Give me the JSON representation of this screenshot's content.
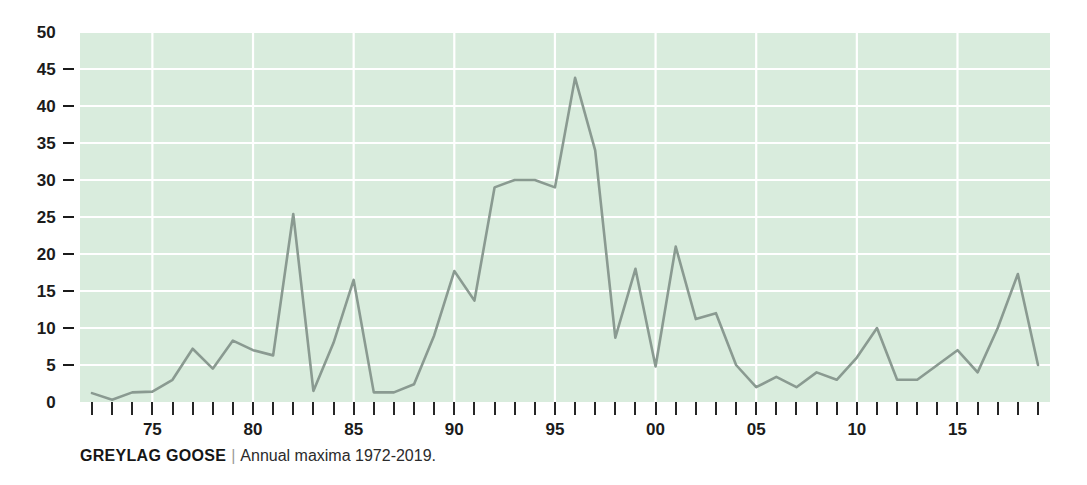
{
  "caption": {
    "title": "GREYLAG GOOSE",
    "separator": "|",
    "subtitle": "Annual maxima 1972-2019."
  },
  "colors": {
    "plot_background": "#d9ecdd",
    "gridline": "#ffffff",
    "line": "#8a9a91",
    "tick": "#262626",
    "text": "#1b1b1b",
    "page_background": "#ffffff"
  },
  "chart_data": {
    "type": "line",
    "title": "GREYLAG GOOSE",
    "subtitle": "Annual maxima 1972-2019.",
    "xlabel": "",
    "ylabel": "",
    "xlim": [
      1972,
      2019
    ],
    "ylim": [
      0,
      50
    ],
    "grid": true,
    "legend": null,
    "y_ticks": [
      0,
      5,
      10,
      15,
      20,
      25,
      30,
      35,
      40,
      45,
      50
    ],
    "y_tick_labels": [
      "0",
      "5",
      "10",
      "15",
      "20",
      "25",
      "30",
      "35",
      "40",
      "45",
      "50"
    ],
    "x_tick_years": [
      1972,
      1973,
      1974,
      1975,
      1976,
      1977,
      1978,
      1979,
      1980,
      1981,
      1982,
      1983,
      1984,
      1985,
      1986,
      1987,
      1988,
      1989,
      1990,
      1991,
      1992,
      1993,
      1994,
      1995,
      1996,
      1997,
      1998,
      1999,
      2000,
      2001,
      2002,
      2003,
      2004,
      2005,
      2006,
      2007,
      2008,
      2009,
      2010,
      2011,
      2012,
      2013,
      2014,
      2015,
      2016,
      2017,
      2018,
      2019
    ],
    "x_labeled_ticks": [
      {
        "year": 1975,
        "label": "75"
      },
      {
        "year": 1980,
        "label": "80"
      },
      {
        "year": 1985,
        "label": "85"
      },
      {
        "year": 1990,
        "label": "90"
      },
      {
        "year": 1995,
        "label": "95"
      },
      {
        "year": 2000,
        "label": "00"
      },
      {
        "year": 2005,
        "label": "05"
      },
      {
        "year": 2010,
        "label": "10"
      },
      {
        "year": 2015,
        "label": "15"
      }
    ],
    "x": [
      1972,
      1973,
      1974,
      1975,
      1976,
      1977,
      1978,
      1979,
      1980,
      1981,
      1982,
      1983,
      1984,
      1985,
      1986,
      1987,
      1988,
      1989,
      1990,
      1991,
      1992,
      1993,
      1994,
      1995,
      1996,
      1997,
      1998,
      1999,
      2000,
      2001,
      2002,
      2003,
      2004,
      2005,
      2006,
      2007,
      2008,
      2009,
      2010,
      2011,
      2012,
      2013,
      2014,
      2015,
      2016,
      2017,
      2018,
      2019
    ],
    "values": [
      1.2,
      0.3,
      1.3,
      1.4,
      3.0,
      7.2,
      4.5,
      8.3,
      7.0,
      6.3,
      25.4,
      1.5,
      8.0,
      16.5,
      1.3,
      1.3,
      2.4,
      9.0,
      17.7,
      13.7,
      29.0,
      30.0,
      30.0,
      29.0,
      43.8,
      34.0,
      8.7,
      18.0,
      4.8,
      21.0,
      11.2,
      12.0,
      5.0,
      2.0,
      3.4,
      2.0,
      4.0,
      3.0,
      6.0,
      10.0,
      3.0,
      3.0,
      5.0,
      7.0,
      4.0,
      10.0,
      17.3,
      5.0
    ],
    "series_name": "Annual maxima"
  }
}
